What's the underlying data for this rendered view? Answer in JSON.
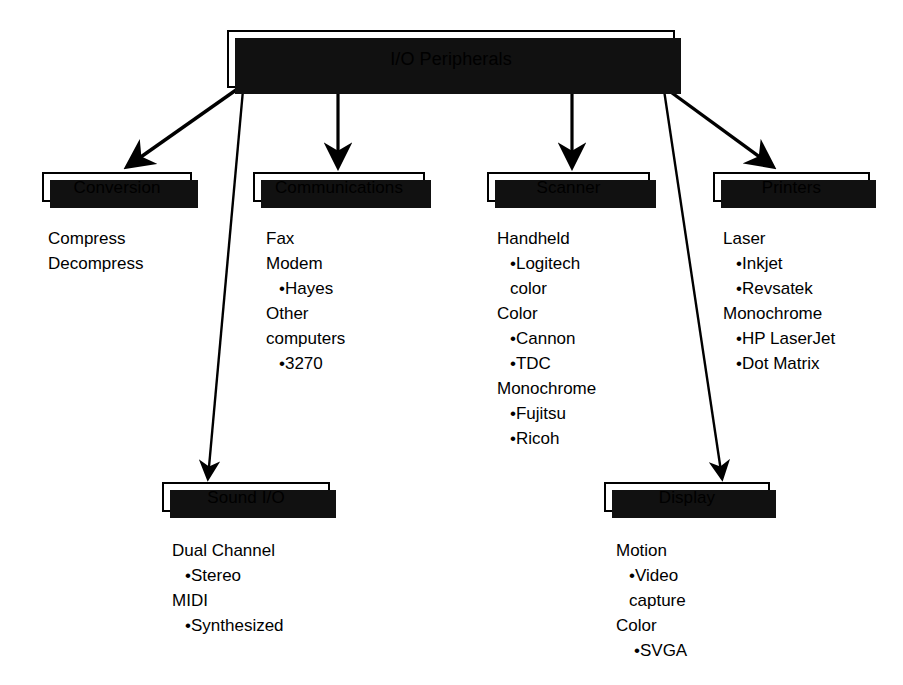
{
  "diagram": {
    "title": "I/O Peripherals",
    "type": "hierarchy-tree",
    "colors": {
      "background": "#ffffff",
      "stroke": "#000000",
      "shadow": "#111111",
      "text": "#000000"
    },
    "root": {
      "label": "I/O Peripherals"
    },
    "nodes": [
      {
        "id": "conversion",
        "label": "Conversion",
        "details": [
          {
            "text": "Compress",
            "bullet": false,
            "indent": 0
          },
          {
            "text": "Decompress",
            "bullet": false,
            "indent": 0
          }
        ]
      },
      {
        "id": "communications",
        "label": "Communications",
        "details": [
          {
            "text": "Fax",
            "bullet": false,
            "indent": 0
          },
          {
            "text": "Modem",
            "bullet": false,
            "indent": 0
          },
          {
            "text": "Hayes",
            "bullet": true,
            "indent": 1
          },
          {
            "text": "Other",
            "bullet": false,
            "indent": 0
          },
          {
            "text": "computers",
            "bullet": false,
            "indent": 0
          },
          {
            "text": "3270",
            "bullet": true,
            "indent": 1
          }
        ]
      },
      {
        "id": "scanner",
        "label": "Scanner",
        "details": [
          {
            "text": "Handheld",
            "bullet": false,
            "indent": 0
          },
          {
            "text": "Logitech",
            "bullet": true,
            "indent": 1
          },
          {
            "text": "color",
            "bullet": false,
            "indent": 1
          },
          {
            "text": "Color",
            "bullet": false,
            "indent": 0
          },
          {
            "text": "Cannon",
            "bullet": true,
            "indent": 1
          },
          {
            "text": "TDC",
            "bullet": true,
            "indent": 1
          },
          {
            "text": "Monochrome",
            "bullet": false,
            "indent": 0
          },
          {
            "text": "Fujitsu",
            "bullet": true,
            "indent": 1
          },
          {
            "text": "Ricoh",
            "bullet": true,
            "indent": 1
          }
        ]
      },
      {
        "id": "printers",
        "label": "Printers",
        "details": [
          {
            "text": "Laser",
            "bullet": false,
            "indent": 0
          },
          {
            "text": "Inkjet",
            "bullet": true,
            "indent": 1
          },
          {
            "text": "Revsatek",
            "bullet": true,
            "indent": 1
          },
          {
            "text": "Monochrome",
            "bullet": false,
            "indent": 0
          },
          {
            "text": "HP LaserJet",
            "bullet": true,
            "indent": 1
          },
          {
            "text": "Dot Matrix",
            "bullet": true,
            "indent": 1
          }
        ]
      },
      {
        "id": "sound-io",
        "label": "Sound I/O",
        "details": [
          {
            "text": "Dual Channel",
            "bullet": false,
            "indent": 0
          },
          {
            "text": "Stereo",
            "bullet": true,
            "indent": 1
          },
          {
            "text": "MIDI",
            "bullet": false,
            "indent": 0
          },
          {
            "text": "Synthesized",
            "bullet": true,
            "indent": 1
          }
        ]
      },
      {
        "id": "display",
        "label": "Display",
        "details": [
          {
            "text": "Motion",
            "bullet": false,
            "indent": 0
          },
          {
            "text": "Video",
            "bullet": true,
            "indent": 1
          },
          {
            "text": "capture",
            "bullet": false,
            "indent": 1
          },
          {
            "text": "Color",
            "bullet": false,
            "indent": 0
          },
          {
            "text": "SVGA",
            "bullet": true,
            "indent": 2
          }
        ]
      }
    ],
    "edges": [
      {
        "from": "root",
        "to": "conversion"
      },
      {
        "from": "root",
        "to": "communications"
      },
      {
        "from": "root",
        "to": "scanner"
      },
      {
        "from": "root",
        "to": "printers"
      },
      {
        "from": "root",
        "to": "sound-io"
      },
      {
        "from": "root",
        "to": "display"
      }
    ]
  }
}
